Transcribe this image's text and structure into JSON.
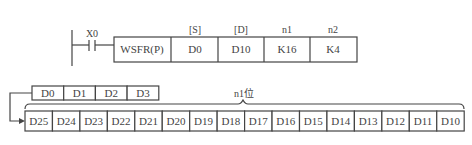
{
  "ladder": {
    "contact_label": "X0",
    "instruction": "WSFR(P)",
    "operands": [
      {
        "header": "[S]",
        "value": "D0"
      },
      {
        "header": "[D]",
        "value": "D10"
      },
      {
        "header": "n1",
        "value": "K16"
      },
      {
        "header": "n2",
        "value": "K4"
      }
    ]
  },
  "source_row": {
    "cells": [
      "D0",
      "D1",
      "D2",
      "D3"
    ]
  },
  "dest_row": {
    "brace_label": "n1位",
    "cells": [
      "D25",
      "D24",
      "D23",
      "D22",
      "D21",
      "D20",
      "D19",
      "D18",
      "D17",
      "D16",
      "D15",
      "D14",
      "D13",
      "D12",
      "D11",
      "D10"
    ]
  }
}
